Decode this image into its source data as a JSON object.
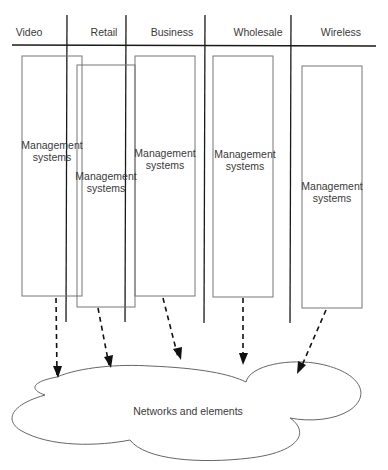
{
  "lanes": [
    {
      "label": "Video",
      "label_x": 29,
      "label_y": 26
    },
    {
      "label": "Retail",
      "label_x": 104,
      "label_y": 26
    },
    {
      "label": "Business",
      "label_x": 172,
      "label_y": 26
    },
    {
      "label": "Wholesale",
      "label_x": 258,
      "label_y": 26
    },
    {
      "label": "Wireless",
      "label_x": 341,
      "label_y": 26
    }
  ],
  "management_boxes": [
    {
      "lane": "Video",
      "line1": "Management",
      "line2": "systems",
      "x": 22,
      "y": 56,
      "w": 60,
      "h": 240,
      "label_x": 52,
      "label_y": 140
    },
    {
      "lane": "Retail",
      "line1": "Management",
      "line2": "systems",
      "x": 77,
      "y": 65,
      "w": 58,
      "h": 242,
      "label_x": 106,
      "label_y": 170
    },
    {
      "lane": "Business",
      "line1": "Management",
      "line2": "systems",
      "x": 135,
      "y": 56,
      "w": 60,
      "h": 240,
      "label_x": 165,
      "label_y": 148
    },
    {
      "lane": "Wholesale",
      "line1": "Management",
      "line2": "systems",
      "x": 213,
      "y": 56,
      "w": 60,
      "h": 241,
      "label_x": 243,
      "label_y": 148
    },
    {
      "lane": "Wireless",
      "line1": "Management",
      "line2": "systems",
      "x": 302,
      "y": 66,
      "w": 60,
      "h": 242,
      "label_x": 332,
      "label_y": 180
    }
  ],
  "cloud": {
    "label": "Networks and elements",
    "label_x": 188,
    "label_y": 405
  },
  "colors": {
    "lane_line": "#1a1a1a",
    "box_border": "#777777",
    "cloud_border": "#666666",
    "arrow": "#111111",
    "text": "#3a3a3a"
  }
}
